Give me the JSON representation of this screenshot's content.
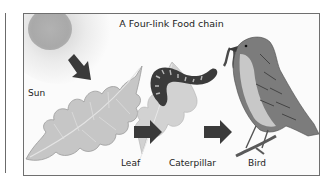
{
  "diagram": {
    "title": "A Four-link Food chain",
    "type": "food-chain",
    "nodes": [
      {
        "id": "sun",
        "label": "Sun"
      },
      {
        "id": "leaf",
        "label": "Leaf"
      },
      {
        "id": "caterpillar",
        "label": "Caterpillar"
      },
      {
        "id": "bird",
        "label": "Bird"
      }
    ],
    "edges": [
      {
        "from": "sun",
        "to": "leaf"
      },
      {
        "from": "leaf",
        "to": "caterpillar"
      },
      {
        "from": "caterpillar",
        "to": "bird"
      }
    ]
  },
  "colors": {
    "frame_border": "#6f6f6f",
    "arrow": "#3a3a3a",
    "sun": "#aaaaaa",
    "leaf": "#c4c4c4",
    "text": "#222222"
  }
}
